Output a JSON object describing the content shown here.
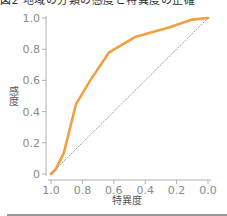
{
  "title": "図2 地域の分類の感度と特異度の正確",
  "chart_data": {
    "type": "line",
    "title": "図2 地域の分類の感度と特異度の正確",
    "xlabel": "特異度",
    "ylabel": "感度",
    "x_reversed": true,
    "xlim": [
      1.0,
      0.0
    ],
    "ylim": [
      0,
      1.0
    ],
    "x_ticks": [
      "1.0",
      "0.8",
      "0.6",
      "0.4",
      "0.2",
      "0.0"
    ],
    "y_ticks": [
      "0",
      "0.2",
      "0.4",
      "0.6",
      "0.8",
      "1.0"
    ],
    "grid": false,
    "series": [
      {
        "name": "ROC",
        "color": "#F0A040",
        "x": [
          1.0,
          0.97,
          0.92,
          0.84,
          0.75,
          0.63,
          0.46,
          0.25,
          0.1,
          0.0
        ],
        "y": [
          0.0,
          0.03,
          0.13,
          0.45,
          0.6,
          0.78,
          0.88,
          0.94,
          0.99,
          1.0
        ]
      },
      {
        "name": "reference",
        "color": "#9a9a9a",
        "style": "dotted",
        "x": [
          1.0,
          0.0
        ],
        "y": [
          0.0,
          1.0
        ]
      }
    ]
  }
}
